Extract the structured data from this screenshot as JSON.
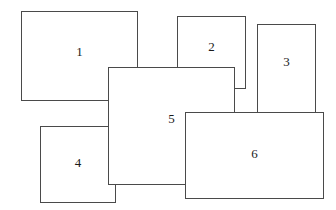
{
  "figure": {
    "title": "",
    "canvas": {
      "width": 336,
      "height": 210,
      "background": "#ffffff"
    },
    "stroke_color": "#4a4a4a",
    "label_color": "#1a1a1a",
    "rectangles": [
      {
        "label": "1",
        "x": 21,
        "y": 11,
        "width": 117,
        "height": 90,
        "z": 1,
        "label_x_pct": 50,
        "label_y_pct": 45
      },
      {
        "label": "2",
        "x": 177,
        "y": 16,
        "width": 69,
        "height": 73,
        "z": 2,
        "label_x_pct": 50,
        "label_y_pct": 42
      },
      {
        "label": "3",
        "x": 257,
        "y": 24,
        "width": 59,
        "height": 91,
        "z": 3,
        "label_x_pct": 50,
        "label_y_pct": 42
      },
      {
        "label": "4",
        "x": 40,
        "y": 126,
        "width": 76,
        "height": 77,
        "z": 4,
        "label_x_pct": 50,
        "label_y_pct": 48
      },
      {
        "label": "5",
        "x": 108,
        "y": 67,
        "width": 127,
        "height": 118,
        "z": 5,
        "label_x_pct": 50,
        "label_y_pct": 44
      },
      {
        "label": "6",
        "x": 185,
        "y": 112,
        "width": 139,
        "height": 87,
        "z": 6,
        "label_x_pct": 50,
        "label_y_pct": 48
      }
    ]
  }
}
